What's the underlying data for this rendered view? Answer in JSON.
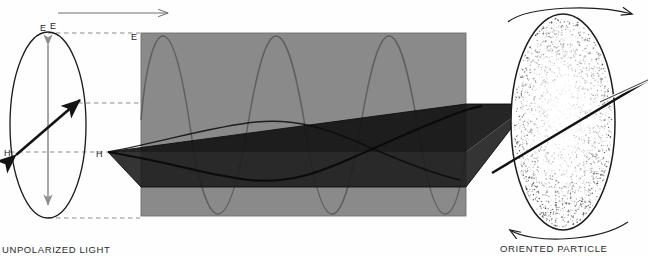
{
  "figure": {
    "width": 648,
    "height": 256,
    "background": "#fefefe"
  },
  "colors": {
    "slab_gray": "#8a8a8a",
    "plane_dark": "#141414",
    "plane_mid": "#2e2e2e",
    "outline": "#1d1d1d",
    "wave_stroke": "#5a5a5a",
    "dashed_gray": "#8d8d8d",
    "arrow_gray": "#8f8f8f",
    "stipple": "#3a3a3a",
    "text": "#2a2a2a"
  },
  "left_panel": {
    "name": "unpolarized-light-cross-section",
    "caption": "UNPOLARIZED LIGHT",
    "e_axis_label": "E",
    "h_axis_label": "H",
    "vector_label": "",
    "ellipse": {
      "cx": 48,
      "cy": 125,
      "rx": 38,
      "ry": 93
    }
  },
  "top_axis": {
    "name": "propagation-direction-arrow",
    "label": "E",
    "direction": "right"
  },
  "slab": {
    "name": "propagation-slab",
    "e_corner_label": "E",
    "h_corner_label": "H",
    "x": 141,
    "y": 33,
    "width": 325,
    "height": 183,
    "wave_peaks": 2,
    "wave_troughs": 2
  },
  "right_panel": {
    "name": "oriented-particle",
    "caption": "ORIENTED PARTICLE",
    "rotation_top": "clockwise-top-arrow",
    "rotation_bottom": "counter-bottom-arrow",
    "ellipse": {
      "cx": 563,
      "cy": 122,
      "rx": 52,
      "ry": 108
    }
  }
}
